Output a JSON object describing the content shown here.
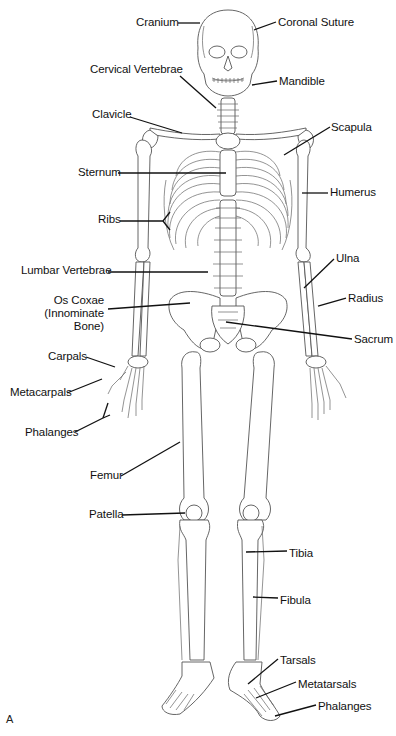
{
  "figure": {
    "panel_letter": "A"
  },
  "labels": [
    {
      "id": "cranium",
      "text": "Cranium",
      "x": 136,
      "y": 16,
      "align": "left",
      "leader": [
        [
          178,
          23
        ],
        [
          200,
          23
        ]
      ]
    },
    {
      "id": "coronal-suture",
      "text": "Coronal Suture",
      "x": 278,
      "y": 16,
      "align": "left",
      "leader": [
        [
          276,
          22
        ],
        [
          254,
          30
        ]
      ]
    },
    {
      "id": "cervical-vertebrae",
      "text": "Cervical Vertebrae",
      "x": 90,
      "y": 63,
      "align": "left",
      "leader": [
        [
          180,
          76
        ],
        [
          216,
          108
        ]
      ]
    },
    {
      "id": "mandible",
      "text": "Mandible",
      "x": 279,
      "y": 75,
      "align": "left",
      "leader": [
        [
          277,
          81
        ],
        [
          252,
          85
        ]
      ]
    },
    {
      "id": "clavicle",
      "text": "Clavicle",
      "x": 92,
      "y": 108,
      "align": "left",
      "leader": [
        [
          130,
          117
        ],
        [
          182,
          133
        ]
      ]
    },
    {
      "id": "scapula",
      "text": "Scapula",
      "x": 331,
      "y": 121,
      "align": "left",
      "leader": [
        [
          330,
          127
        ],
        [
          284,
          155
        ]
      ]
    },
    {
      "id": "sternum",
      "text": "Sternum",
      "x": 78,
      "y": 166,
      "align": "left",
      "leader": [
        [
          118,
          173
        ],
        [
          226,
          173
        ]
      ]
    },
    {
      "id": "humerus",
      "text": "Humerus",
      "x": 330,
      "y": 186,
      "align": "left",
      "leader": [
        [
          328,
          193
        ],
        [
          302,
          193
        ]
      ]
    },
    {
      "id": "ribs",
      "text": "Ribs",
      "x": 98,
      "y": 213,
      "align": "left",
      "leader": [
        [
          120,
          221
        ],
        [
          163,
          221
        ]
      ]
    },
    {
      "id": "lumbar-vertebrae",
      "text": "Lumbar Vertebrae",
      "x": 21,
      "y": 264,
      "align": "left",
      "leader": [
        [
          108,
          272
        ],
        [
          208,
          272
        ]
      ]
    },
    {
      "id": "ulna",
      "text": "Ulna",
      "x": 336,
      "y": 252,
      "align": "left",
      "leader": [
        [
          334,
          259
        ],
        [
          304,
          288
        ]
      ]
    },
    {
      "id": "os-coxae",
      "text": "Os Coxae\n(Innominate\nBone)",
      "x": 24,
      "y": 294,
      "align": "right",
      "w": 80,
      "leader": [
        [
          108,
          309
        ],
        [
          190,
          303
        ]
      ]
    },
    {
      "id": "radius",
      "text": "Radius",
      "x": 348,
      "y": 292,
      "align": "left",
      "leader": [
        [
          346,
          298
        ],
        [
          318,
          306
        ]
      ]
    },
    {
      "id": "sacrum",
      "text": "Sacrum",
      "x": 354,
      "y": 333,
      "align": "left",
      "leader": [
        [
          352,
          339
        ],
        [
          226,
          322
        ]
      ]
    },
    {
      "id": "carpals",
      "text": "Carpals",
      "x": 48,
      "y": 350,
      "align": "left",
      "leader": [
        [
          86,
          357
        ],
        [
          115,
          367
        ]
      ]
    },
    {
      "id": "metacarpals",
      "text": "Metacarpals",
      "x": 10,
      "y": 386,
      "align": "left",
      "leader": [
        [
          67,
          393
        ],
        [
          102,
          379
        ]
      ]
    },
    {
      "id": "phalanges-hand",
      "text": "Phalanges",
      "x": 25,
      "y": 426,
      "align": "left",
      "leader": [
        [
          75,
          432
        ],
        [
          103,
          418
        ]
      ],
      "fork": [
        [
          103,
          418
        ],
        [
          108,
          403
        ],
        [
          103,
          418
        ],
        [
          110,
          415
        ]
      ]
    },
    {
      "id": "femur",
      "text": "Femur",
      "x": 90,
      "y": 469,
      "align": "left",
      "leader": [
        [
          121,
          476
        ],
        [
          180,
          442
        ]
      ]
    },
    {
      "id": "patella",
      "text": "Patella",
      "x": 89,
      "y": 508,
      "align": "left",
      "leader": [
        [
          122,
          515
        ],
        [
          185,
          513
        ]
      ]
    },
    {
      "id": "tibia",
      "text": "Tibia",
      "x": 289,
      "y": 547,
      "align": "left",
      "leader": [
        [
          287,
          551
        ],
        [
          246,
          552
        ]
      ]
    },
    {
      "id": "fibula",
      "text": "Fibula",
      "x": 280,
      "y": 594,
      "align": "left",
      "leader": [
        [
          278,
          598
        ],
        [
          253,
          597
        ]
      ]
    },
    {
      "id": "tarsals",
      "text": "Tarsals",
      "x": 280,
      "y": 654,
      "align": "left",
      "leader": [
        [
          278,
          659
        ],
        [
          248,
          684
        ]
      ]
    },
    {
      "id": "metatarsals",
      "text": "Metatarsals",
      "x": 298,
      "y": 678,
      "align": "left",
      "leader": [
        [
          296,
          682
        ],
        [
          256,
          698
        ]
      ]
    },
    {
      "id": "phalanges-foot",
      "text": "Phalanges",
      "x": 318,
      "y": 700,
      "align": "left",
      "leader": [
        [
          316,
          705
        ],
        [
          275,
          716
        ]
      ]
    }
  ]
}
